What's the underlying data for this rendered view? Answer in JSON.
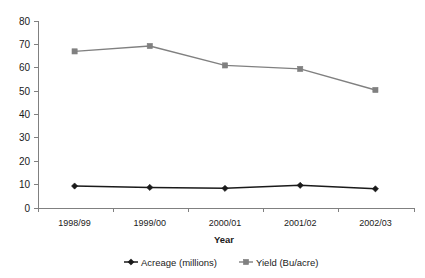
{
  "chart_data": {
    "type": "line",
    "title": "",
    "xlabel": "Year",
    "ylabel": "",
    "categories": [
      "1998/99",
      "1999/00",
      "2000/01",
      "2001/02",
      "2002/03"
    ],
    "series": [
      {
        "name": "Acreage (millions)",
        "values": [
          9.4,
          8.8,
          8.4,
          9.7,
          8.2
        ],
        "color": "#1a1a1a",
        "marker": "diamond"
      },
      {
        "name": "Yield (Bu/acre)",
        "values": [
          67.0,
          69.3,
          61.0,
          59.5,
          50.5
        ],
        "color": "#808080",
        "marker": "square"
      }
    ],
    "ylim": [
      0,
      80
    ],
    "yticks": [
      0,
      10,
      20,
      30,
      40,
      50,
      60,
      70,
      80
    ],
    "ytick_labels": [
      "0",
      "10",
      "20",
      "30",
      "40",
      "50",
      "60",
      "70",
      "80"
    ],
    "grid": false,
    "legend_position": "bottom"
  },
  "axes": {
    "x_axis_title": "Year",
    "y_axis_title": ""
  },
  "legend": {
    "items": [
      {
        "label": "Acreage (millions)",
        "color": "#1a1a1a",
        "marker": "diamond"
      },
      {
        "label": "Yield (Bu/acre)",
        "color": "#808080",
        "marker": "square"
      }
    ]
  }
}
